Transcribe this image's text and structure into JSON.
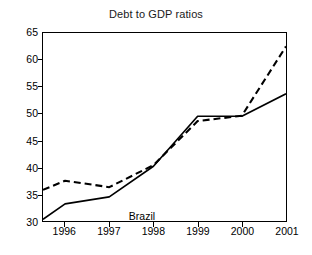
{
  "chart_data": {
    "type": "line",
    "title": "Debt to GDP ratios",
    "xlabel": "",
    "ylabel": "",
    "ylim": [
      30,
      65
    ],
    "xlim": [
      1995.5,
      2001
    ],
    "yticks": [
      30,
      35,
      40,
      45,
      50,
      55,
      60,
      65
    ],
    "xticks": [
      1996,
      1997,
      1998,
      1999,
      2000,
      2001
    ],
    "grid": false,
    "legend": "none",
    "annotations": [
      {
        "text": "Brazil",
        "x": 1997.45,
        "y": 32.2
      }
    ],
    "series": [
      {
        "name": "Brazil",
        "style": "solid",
        "color": "#000000",
        "x": [
          1995.5,
          1996,
          1997,
          1998,
          1999,
          2000,
          2001
        ],
        "values": [
          30.3,
          33.2,
          34.5,
          40.2,
          49.5,
          49.5,
          53.7
        ]
      },
      {
        "name": "Other",
        "style": "dashed",
        "color": "#000000",
        "x": [
          1995.5,
          1996,
          1997,
          1998,
          1999,
          2000,
          2001
        ],
        "values": [
          35.8,
          37.5,
          36.3,
          40.4,
          48.6,
          49.6,
          62.5
        ]
      }
    ]
  },
  "axis": {
    "y_labels": [
      "65",
      "60",
      "55",
      "50",
      "45",
      "40",
      "35",
      "30"
    ],
    "x_labels": [
      "1996",
      "1997",
      "1998",
      "1999",
      "2000",
      "2001"
    ]
  },
  "annotation": {
    "brazil": "Brazil"
  },
  "colors": {
    "line": "#000000",
    "axis": "#000000",
    "background": "#ffffff",
    "title": "#1a1a1a"
  }
}
